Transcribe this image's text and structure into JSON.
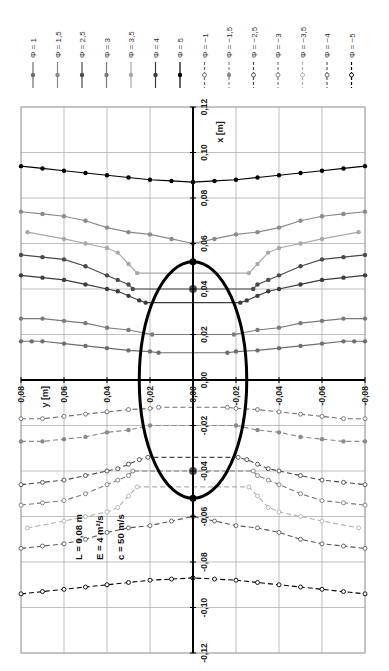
{
  "chart_data": {
    "type": "line",
    "orientation": "rotated-90-clockwise",
    "title": "",
    "xlabel": "x [m]",
    "ylabel": "y [m]",
    "xlim": [
      -0.12,
      0.12
    ],
    "ylim": [
      -0.08,
      0.08
    ],
    "x_ticks": [
      "0,12",
      "0,10",
      "0,08",
      "0,06",
      "0,04",
      "0,02",
      "0,00",
      "-0,02",
      "-0,04",
      "-0,06",
      "-0,08",
      "-0,10",
      "-0,12"
    ],
    "y_ticks": [
      "0,08",
      "0,06",
      "0,04",
      "0,02",
      "0,00",
      "-0,02",
      "-0,04",
      "-0,06",
      "-0,08"
    ],
    "grid": true,
    "legend_position": "top",
    "annotation": [
      "L = 0,08 m",
      "E = 4 m²/s",
      "c = 50 m/s"
    ],
    "ellipse": {
      "center": [
        0,
        0
      ],
      "semi_x": 0.052,
      "semi_y": 0.025,
      "foci_x": [
        0.04,
        -0.04
      ]
    },
    "series": [
      {
        "name": "Φ = 1",
        "style": "solid",
        "marker": "filled",
        "color": "#6e6e6e",
        "y": [
          0.08,
          0.075,
          0.07,
          0.06,
          0.05,
          0.04,
          0.03,
          0.02,
          0.016
        ],
        "x": [
          0.017,
          0.017,
          0.017,
          0.016,
          0.015,
          0.014,
          0.013,
          0.0125,
          0.012
        ]
      },
      {
        "name": "Φ = 1,5",
        "style": "solid",
        "marker": "filled",
        "color": "#8a8a8a",
        "y": [
          0.08,
          0.07,
          0.06,
          0.05,
          0.04,
          0.03,
          0.02,
          0.01,
          0.0
        ],
        "x": [
          0.074,
          0.073,
          0.072,
          0.07,
          0.067,
          0.065,
          0.064,
          0.062,
          0.06
        ]
      },
      {
        "name": "Φ = 2,5",
        "style": "solid",
        "marker": "filled",
        "color": "#4a4a4a",
        "y": [
          0.08,
          0.07,
          0.06,
          0.05,
          0.04,
          0.035,
          0.03,
          0.028
        ],
        "x": [
          0.055,
          0.054,
          0.053,
          0.05,
          0.046,
          0.044,
          0.042,
          0.04
        ]
      },
      {
        "name": "Φ = 3",
        "style": "solid",
        "marker": "filled",
        "color": "#7a7a7a",
        "y": [
          0.08,
          0.07,
          0.06,
          0.05,
          0.04,
          0.03,
          0.019
        ],
        "x": [
          0.027,
          0.027,
          0.026,
          0.025,
          0.023,
          0.022,
          0.02
        ]
      },
      {
        "name": "Φ = 3,5",
        "style": "solid",
        "marker": "filled",
        "color": "#a8a8a8",
        "y": [
          0.077,
          0.06,
          0.05,
          0.04,
          0.035,
          0.03,
          0.026
        ],
        "x": [
          0.065,
          0.062,
          0.06,
          0.058,
          0.056,
          0.051,
          0.047
        ]
      },
      {
        "name": "Φ = 4",
        "style": "solid",
        "marker": "filled",
        "color": "#3c3c3c",
        "y": [
          0.08,
          0.07,
          0.06,
          0.05,
          0.04,
          0.035,
          0.03,
          0.025,
          0.022
        ],
        "x": [
          0.046,
          0.045,
          0.044,
          0.042,
          0.04,
          0.039,
          0.037,
          0.035,
          0.034
        ]
      },
      {
        "name": "Φ = 5",
        "style": "solid",
        "marker": "filled",
        "color": "#000000",
        "y": [
          0.08,
          0.07,
          0.06,
          0.05,
          0.04,
          0.03,
          0.02,
          0.01,
          0.0
        ],
        "x": [
          0.094,
          0.093,
          0.092,
          0.091,
          0.09,
          0.089,
          0.088,
          0.0875,
          0.087
        ]
      },
      {
        "name": "Φ = −1",
        "style": "dashed",
        "marker": "open",
        "color": "#6e6e6e",
        "y": [
          0.08,
          0.07,
          0.06,
          0.05,
          0.04,
          0.03,
          0.02,
          0.016
        ],
        "x": [
          -0.017,
          -0.017,
          -0.016,
          -0.015,
          -0.014,
          -0.013,
          -0.0125,
          -0.012
        ]
      },
      {
        "name": "Φ = −1,5",
        "style": "dashed",
        "marker": "filled",
        "color": "#8a8a8a",
        "y": [
          0.08,
          0.07,
          0.06,
          0.05,
          0.04,
          0.03,
          0.02
        ],
        "x": [
          -0.027,
          -0.027,
          -0.026,
          -0.025,
          -0.023,
          -0.022,
          -0.02
        ]
      },
      {
        "name": "Φ = −2,5",
        "style": "dashed",
        "marker": "open",
        "color": "#4a4a4a",
        "y": [
          0.08,
          0.07,
          0.06,
          0.05,
          0.04,
          0.035,
          0.03,
          0.025,
          0.021
        ],
        "x": [
          -0.046,
          -0.045,
          -0.044,
          -0.042,
          -0.04,
          -0.039,
          -0.037,
          -0.035,
          -0.034
        ]
      },
      {
        "name": "Φ = −3",
        "style": "dashed",
        "marker": "open",
        "color": "#7a7a7a",
        "y": [
          0.08,
          0.07,
          0.06,
          0.05,
          0.04,
          0.035,
          0.03,
          0.028
        ],
        "x": [
          -0.055,
          -0.054,
          -0.053,
          -0.05,
          -0.046,
          -0.044,
          -0.042,
          -0.04
        ]
      },
      {
        "name": "Φ = −3,5",
        "style": "dashed",
        "marker": "open",
        "color": "#b0b0b0",
        "y": [
          0.077,
          0.06,
          0.05,
          0.04,
          0.035,
          0.03,
          0.026
        ],
        "x": [
          -0.065,
          -0.062,
          -0.06,
          -0.058,
          -0.056,
          -0.051,
          -0.047
        ]
      },
      {
        "name": "Φ = −4",
        "style": "dashed",
        "marker": "open",
        "color": "#5a5a5a",
        "y": [
          0.08,
          0.07,
          0.06,
          0.05,
          0.04,
          0.03,
          0.02,
          0.01,
          0.0
        ],
        "x": [
          -0.074,
          -0.073,
          -0.072,
          -0.07,
          -0.067,
          -0.065,
          -0.064,
          -0.062,
          -0.06
        ]
      },
      {
        "name": "Φ = −5",
        "style": "dashed",
        "marker": "open",
        "color": "#000000",
        "y": [
          0.08,
          0.07,
          0.06,
          0.05,
          0.04,
          0.03,
          0.02,
          0.01,
          0.0
        ],
        "x": [
          -0.094,
          -0.093,
          -0.092,
          -0.091,
          -0.09,
          -0.089,
          -0.088,
          -0.0875,
          -0.087
        ]
      }
    ]
  },
  "legend": {
    "items": [
      {
        "label": "Φ = 1"
      },
      {
        "label": "Φ = 1,5"
      },
      {
        "label": "Φ = 2,5"
      },
      {
        "label": "Φ = 3"
      },
      {
        "label": "Φ = 3,5"
      },
      {
        "label": "Φ = 4"
      },
      {
        "label": "Φ = 5"
      },
      {
        "label": "Φ = −1"
      },
      {
        "label": "Φ = −1,5"
      },
      {
        "label": "Φ = −2,5"
      },
      {
        "label": "Φ = −3"
      },
      {
        "label": "Φ = −3,5"
      },
      {
        "label": "Φ = −4"
      },
      {
        "label": "Φ = −5"
      }
    ]
  },
  "axes": {
    "x_title": "x [m]",
    "y_title": "y [m]"
  },
  "annotation": {
    "line1": "L = 0,08 m",
    "line2": "E = 4 m²/s",
    "line3": "c = 50 m/s"
  }
}
